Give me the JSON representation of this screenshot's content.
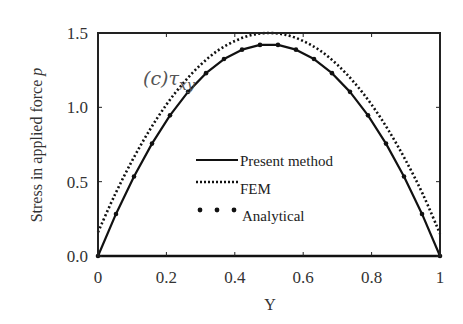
{
  "chart_data": {
    "type": "line",
    "title": "",
    "annotation": "(c)τxy",
    "xlabel": "Y",
    "ylabel": "Stress in applied force p",
    "xlim": [
      0,
      1
    ],
    "ylim": [
      0,
      1.5
    ],
    "xticks": [
      0,
      0.2,
      0.4,
      0.6,
      0.8,
      1
    ],
    "xtick_labels": [
      "0",
      "0.2",
      "0.4",
      "0.6",
      "0.8",
      "1"
    ],
    "yticks": [
      0,
      0.5,
      1.0,
      1.5
    ],
    "ytick_labels": [
      "0.0",
      "0.5",
      "1.0",
      "1.5"
    ],
    "grid": false,
    "legend_position": "center",
    "series": [
      {
        "name": "Present method",
        "style": "solid",
        "x": [
          0,
          0.0526,
          0.1053,
          0.1579,
          0.2105,
          0.2632,
          0.3158,
          0.3684,
          0.4211,
          0.4737,
          0.5263,
          0.5789,
          0.6316,
          0.6842,
          0.7368,
          0.7895,
          0.8421,
          0.8947,
          0.9474,
          1
        ],
        "y": [
          0,
          0.283,
          0.535,
          0.756,
          0.946,
          1.104,
          1.23,
          1.325,
          1.388,
          1.42,
          1.42,
          1.388,
          1.325,
          1.23,
          1.104,
          0.946,
          0.756,
          0.535,
          0.283,
          0
        ]
      },
      {
        "name": "FEM",
        "style": "dotted",
        "x": [
          0,
          0.05,
          0.1,
          0.15,
          0.2,
          0.25,
          0.3,
          0.35,
          0.4,
          0.45,
          0.5,
          0.55,
          0.6,
          0.65,
          0.7,
          0.75,
          0.8,
          0.85,
          0.9,
          0.95,
          1
        ],
        "y": [
          0.16,
          0.415,
          0.642,
          0.843,
          1.018,
          1.165,
          1.286,
          1.381,
          1.446,
          1.487,
          1.5,
          1.487,
          1.446,
          1.381,
          1.286,
          1.165,
          1.018,
          0.843,
          0.642,
          0.415,
          0.15
        ]
      },
      {
        "name": "Analytical",
        "style": "markers",
        "x": [
          0,
          0.0526,
          0.1053,
          0.1579,
          0.2105,
          0.2632,
          0.3158,
          0.3684,
          0.4211,
          0.4737,
          0.5263,
          0.5789,
          0.6316,
          0.6842,
          0.7368,
          0.7895,
          0.8421,
          0.8947,
          0.9474,
          1
        ],
        "y": [
          0,
          0.283,
          0.535,
          0.756,
          0.946,
          1.104,
          1.23,
          1.325,
          1.388,
          1.42,
          1.42,
          1.388,
          1.325,
          1.23,
          1.104,
          0.946,
          0.756,
          0.535,
          0.283,
          0
        ]
      }
    ]
  }
}
